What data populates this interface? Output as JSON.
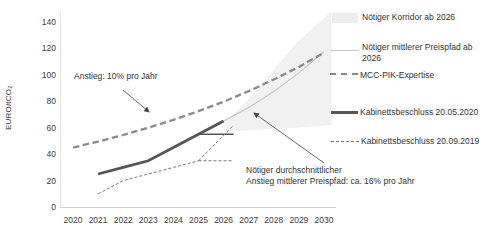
{
  "figure": {
    "y_axis_title": "EURO/tCO₂",
    "annotations": {
      "growth_10": "Anstieg: 10% pro Jahr",
      "growth_16_line1": "Nötiger durchschnittlicher",
      "growth_16_line2": "Anstieg mittlerer Preispfad: ca. 16% pro Jahr"
    },
    "legend": [
      {
        "label": "Nötiger Korridor ab 2026"
      },
      {
        "label": "Nötiger mittlerer Preispfad ab 2026"
      },
      {
        "label": "MCC-PIK-Expertise"
      },
      {
        "label": "Kabinettsbeschluss 20.05.2020"
      },
      {
        "label": "Kabinettsbeschluss 20.09.2019"
      }
    ]
  },
  "chart_data": {
    "type": "line",
    "title": "",
    "xlabel": "",
    "ylabel": "EURO/tCO₂",
    "ylim": [
      0,
      140
    ],
    "y_ticks": [
      0,
      20,
      40,
      60,
      80,
      100,
      120,
      140
    ],
    "x": [
      2020,
      2021,
      2022,
      2023,
      2024,
      2025,
      2026,
      2027,
      2028,
      2029,
      2030
    ],
    "grid": false,
    "legend_position": "right",
    "series": [
      {
        "name": "MCC-PIK-Expertise",
        "style": "dashed",
        "color": "#8a8a8a",
        "note": "Anstieg: 10% pro Jahr",
        "x": [
          2020,
          2021,
          2022,
          2023,
          2024,
          2025,
          2026,
          2027,
          2028,
          2029,
          2030
        ],
        "values": [
          45,
          49.5,
          54.5,
          60,
          66,
          72.5,
          79.7,
          87.7,
          96.5,
          106,
          116.7
        ]
      },
      {
        "name": "Kabinettsbeschluss 20.05.2020",
        "style": "solid-thick",
        "color": "#555555",
        "x": [
          2021,
          2022,
          2023,
          2024,
          2025,
          2026
        ],
        "values": [
          25,
          30,
          35,
          45,
          55,
          65
        ],
        "corridor_2026": [
          55,
          65
        ]
      },
      {
        "name": "Kabinettsbeschluss 20.09.2019",
        "style": "dotted",
        "color": "#777777",
        "x": [
          2021,
          2022,
          2023,
          2024,
          2025
        ],
        "values": [
          10,
          20,
          25,
          30,
          35
        ],
        "corridor_2026": [
          35,
          60
        ]
      },
      {
        "name": "Nötiger mittlerer Preispfad ab 2026",
        "style": "thin-light",
        "color": "#c8c8c8",
        "note": "Nötiger durchschnittlicher Anstieg mittlerer Preispfad: ca. 16% pro Jahr",
        "x": [
          2026,
          2027,
          2028,
          2029,
          2030
        ],
        "values": [
          65,
          75.4,
          87.5,
          101.5,
          117.7
        ]
      }
    ],
    "band": {
      "name": "Nötiger Korridor ab 2026",
      "color": "#f1f1f1",
      "x": [
        2026,
        2027,
        2028,
        2029,
        2030.3
      ],
      "upper": [
        62,
        82,
        104,
        126,
        148
      ],
      "lower": [
        57,
        58,
        59,
        60,
        62
      ]
    },
    "corridor_lines": [
      {
        "from": [
          2025,
          55
        ],
        "to": [
          2026.4,
          55
        ]
      },
      {
        "from": [
          2025,
          35
        ],
        "to": [
          2026.4,
          35
        ]
      },
      {
        "from": [
          2025,
          35
        ],
        "to": [
          2026.4,
          62
        ]
      }
    ]
  }
}
